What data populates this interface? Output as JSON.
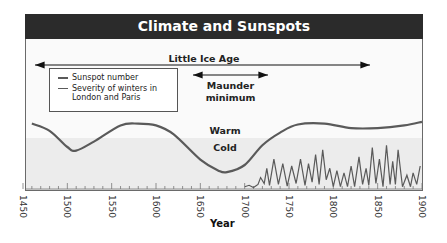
{
  "chart_data": {
    "type": "line",
    "title": "Climate and Sunspots",
    "xlabel": "Year",
    "ylabel": "",
    "xlim": [
      1450,
      1900
    ],
    "x_ticks": [
      1450,
      1500,
      1550,
      1600,
      1650,
      1700,
      1750,
      1800,
      1850,
      1900
    ],
    "legend": [
      "Sunspot number",
      "Severity of winters in London and Paris"
    ],
    "legend_position": "upper-left",
    "annotations": [
      {
        "text": "Little Ice Age",
        "span": [
          1450,
          1850
        ],
        "type": "double-arrow"
      },
      {
        "text": "Maunder minimum",
        "span": [
          1645,
          1715
        ],
        "type": "double-arrow"
      },
      {
        "text": "Warm",
        "region": "upper band"
      },
      {
        "text": "Cold",
        "region": "lower band"
      }
    ],
    "series": [
      {
        "name": "Severity of winters in London and Paris",
        "x": [
          1460,
          1480,
          1500,
          1510,
          1530,
          1560,
          1580,
          1600,
          1620,
          1650,
          1670,
          1680,
          1700,
          1720,
          1740,
          1760,
          1790,
          1820,
          1850,
          1880,
          1900
        ],
        "values": [
          0.8,
          0.4,
          -0.5,
          -0.7,
          -0.2,
          0.7,
          0.8,
          0.7,
          0.2,
          -1.2,
          -1.8,
          -1.9,
          -1.5,
          -0.4,
          0.3,
          0.75,
          0.8,
          0.55,
          0.55,
          0.7,
          0.9
        ]
      },
      {
        "name": "Sunspot number",
        "x": [
          1700,
          1705,
          1710,
          1715,
          1718,
          1722,
          1725,
          1728,
          1733,
          1738,
          1743,
          1748,
          1753,
          1758,
          1763,
          1768,
          1772,
          1776,
          1780,
          1784,
          1788,
          1792,
          1796,
          1800,
          1804,
          1808,
          1812,
          1816,
          1820,
          1824,
          1829,
          1833,
          1837,
          1840,
          1844,
          1848,
          1852,
          1856,
          1860,
          1864,
          1867,
          1870,
          1873,
          1878,
          1883,
          1887,
          1890,
          1894,
          1898
        ],
        "values": [
          5,
          8,
          3,
          10,
          25,
          12,
          45,
          8,
          65,
          10,
          55,
          6,
          50,
          12,
          65,
          8,
          55,
          15,
          75,
          10,
          85,
          20,
          45,
          5,
          40,
          5,
          35,
          5,
          50,
          5,
          70,
          10,
          45,
          8,
          90,
          12,
          65,
          5,
          95,
          10,
          60,
          10,
          85,
          5,
          30,
          5,
          35,
          10,
          50
        ]
      }
    ]
  },
  "colors": {
    "title_bg": "#2b2b2b",
    "title_text": "#ffffff",
    "frame_bg": "#fafafa",
    "cold_band": "#ececec",
    "curve": "#5a5a5a",
    "sunspot": "#5a5a5a"
  }
}
